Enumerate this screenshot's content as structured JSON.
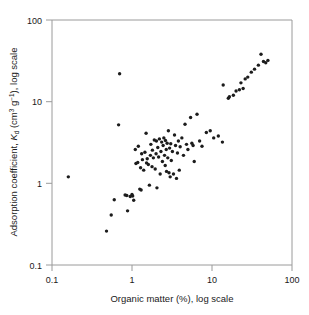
{
  "chart_data": {
    "type": "scatter",
    "title": "",
    "xlabel": "Organic matter (%), log scale",
    "ylabel": "Adsorption coefficient, Kd (cm3 g-1), log scale",
    "ylabel_parts": {
      "lead": "Adsorption coefficient, ",
      "symbol_italic": "K",
      "symbol_sub": "d",
      "units_open": " (cm",
      "units_sup1": "3",
      "units_mid": " g",
      "units_sup2": "−1",
      "units_close": "), log scale"
    },
    "xscale": "log",
    "yscale": "log",
    "xlim": [
      0.1,
      100
    ],
    "ylim": [
      0.1,
      100
    ],
    "xticks": [
      "0.1",
      "1",
      "10",
      "100"
    ],
    "yticks": [
      "0.1",
      "1",
      "10",
      "100"
    ],
    "xtick_values": [
      0.1,
      1,
      10,
      100
    ],
    "ytick_values": [
      0.1,
      1,
      10,
      100
    ],
    "grid": false,
    "legend": false,
    "marker": "circle",
    "marker_color": "#1c1c1c",
    "marker_size_px": 3.4,
    "n_points": 104,
    "points": [
      [
        0.16,
        1.2
      ],
      [
        0.48,
        0.26
      ],
      [
        0.55,
        0.41
      ],
      [
        0.6,
        0.63
      ],
      [
        0.68,
        5.2
      ],
      [
        0.7,
        22.0
      ],
      [
        0.82,
        0.72
      ],
      [
        0.86,
        0.71
      ],
      [
        0.88,
        0.46
      ],
      [
        0.95,
        0.69
      ],
      [
        1.0,
        0.73
      ],
      [
        1.02,
        0.7
      ],
      [
        1.05,
        0.62
      ],
      [
        1.1,
        2.6
      ],
      [
        1.12,
        1.75
      ],
      [
        1.18,
        1.8
      ],
      [
        1.2,
        2.85
      ],
      [
        1.25,
        0.85
      ],
      [
        1.28,
        1.55
      ],
      [
        1.3,
        0.83
      ],
      [
        1.32,
        2.3
      ],
      [
        1.35,
        1.95
      ],
      [
        1.4,
        1.45
      ],
      [
        1.45,
        2.4
      ],
      [
        1.5,
        4.1
      ],
      [
        1.52,
        1.78
      ],
      [
        1.55,
        2.0
      ],
      [
        1.6,
        1.7
      ],
      [
        1.65,
        0.95
      ],
      [
        1.7,
        2.2
      ],
      [
        1.72,
        3.0
      ],
      [
        1.78,
        1.6
      ],
      [
        1.8,
        2.55
      ],
      [
        1.85,
        2.05
      ],
      [
        1.9,
        3.4
      ],
      [
        1.95,
        1.5
      ],
      [
        2.0,
        2.3
      ],
      [
        2.02,
        3.3
      ],
      [
        2.05,
        0.88
      ],
      [
        2.1,
        2.75
      ],
      [
        2.15,
        2.1
      ],
      [
        2.2,
        3.5
      ],
      [
        2.25,
        1.3
      ],
      [
        2.3,
        2.45
      ],
      [
        2.35,
        3.2
      ],
      [
        2.4,
        1.85
      ],
      [
        2.45,
        2.9
      ],
      [
        2.5,
        3.6
      ],
      [
        2.55,
        2.2
      ],
      [
        2.6,
        1.65
      ],
      [
        2.62,
        3.35
      ],
      [
        2.68,
        2.6
      ],
      [
        2.7,
        1.4
      ],
      [
        2.75,
        3.1
      ],
      [
        2.8,
        2.05
      ],
      [
        2.85,
        4.4
      ],
      [
        2.9,
        1.35
      ],
      [
        2.95,
        2.7
      ],
      [
        3.0,
        1.2
      ],
      [
        3.05,
        3.05
      ],
      [
        3.1,
        1.9
      ],
      [
        3.2,
        2.45
      ],
      [
        3.3,
        1.3
      ],
      [
        3.4,
        3.9
      ],
      [
        3.5,
        2.9
      ],
      [
        3.6,
        1.15
      ],
      [
        3.7,
        2.35
      ],
      [
        3.8,
        3.3
      ],
      [
        3.9,
        1.45
      ],
      [
        4.0,
        2.8
      ],
      [
        4.2,
        3.6
      ],
      [
        4.4,
        2.2
      ],
      [
        4.6,
        5.3
      ],
      [
        4.8,
        3.0
      ],
      [
        5.0,
        2.6
      ],
      [
        5.4,
        6.4
      ],
      [
        5.6,
        3.1
      ],
      [
        5.8,
        2.9
      ],
      [
        6.0,
        1.85
      ],
      [
        6.5,
        7.0
      ],
      [
        7.0,
        3.3
      ],
      [
        7.5,
        2.85
      ],
      [
        8.5,
        4.2
      ],
      [
        9.5,
        4.4
      ],
      [
        10.5,
        3.6
      ],
      [
        12.0,
        3.8
      ],
      [
        13.5,
        3.2
      ],
      [
        13.8,
        16.0
      ],
      [
        16.0,
        11.0
      ],
      [
        16.5,
        11.5
      ],
      [
        18.5,
        12.0
      ],
      [
        20.0,
        13.5
      ],
      [
        22.0,
        14.0
      ],
      [
        23.0,
        17.0
      ],
      [
        24.5,
        14.5
      ],
      [
        26.0,
        19.0
      ],
      [
        28.0,
        20.0
      ],
      [
        31.0,
        23.0
      ],
      [
        34.0,
        25.0
      ],
      [
        38.0,
        28.0
      ],
      [
        41.0,
        38.0
      ],
      [
        44.0,
        31.0
      ],
      [
        47.0,
        30.0
      ],
      [
        50.0,
        32.0
      ]
    ]
  }
}
